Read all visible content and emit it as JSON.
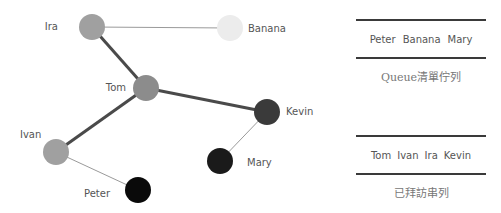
{
  "graph": {
    "nodes": [
      {
        "id": "Ira",
        "label": "Ira",
        "x": 92,
        "y": 27,
        "r": 13,
        "color": "#a0a0a0",
        "label_x": 58,
        "label_y": 30,
        "anchor": "end"
      },
      {
        "id": "Banana",
        "label": "Banana",
        "x": 230,
        "y": 28,
        "r": 13,
        "color": "#ececec",
        "label_x": 248,
        "label_y": 32,
        "anchor": "start"
      },
      {
        "id": "Tom",
        "label": "Tom",
        "x": 146,
        "y": 88,
        "r": 13,
        "color": "#8c8c8c",
        "label_x": 126,
        "label_y": 91,
        "anchor": "end"
      },
      {
        "id": "Kevin",
        "label": "Kevin",
        "x": 267,
        "y": 112,
        "r": 13,
        "color": "#3a3a3a",
        "label_x": 286,
        "label_y": 115,
        "anchor": "start"
      },
      {
        "id": "Ivan",
        "label": "Ivan",
        "x": 56,
        "y": 152,
        "r": 13,
        "color": "#a0a0a0",
        "label_x": 20,
        "label_y": 138,
        "anchor": "start"
      },
      {
        "id": "Mary",
        "label": "Mary",
        "x": 220,
        "y": 161,
        "r": 13,
        "color": "#1a1a1a",
        "label_x": 247,
        "label_y": 166,
        "anchor": "start"
      },
      {
        "id": "Peter",
        "label": "Peter",
        "x": 138,
        "y": 190,
        "r": 13,
        "color": "#0a0a0a",
        "label_x": 110,
        "label_y": 197,
        "anchor": "end"
      }
    ],
    "edges": [
      {
        "from": "Ira",
        "to": "Banana",
        "weight": "thin"
      },
      {
        "from": "Ira",
        "to": "Tom",
        "weight": "thick"
      },
      {
        "from": "Tom",
        "to": "Kevin",
        "weight": "thick"
      },
      {
        "from": "Tom",
        "to": "Ivan",
        "weight": "thick"
      },
      {
        "from": "Kevin",
        "to": "Mary",
        "weight": "thin"
      },
      {
        "from": "Ivan",
        "to": "Peter",
        "weight": "thin"
      }
    ]
  },
  "queue": {
    "items": [
      "Peter",
      "Banana",
      "Mary"
    ],
    "caption": "Queue清單佇列"
  },
  "visited": {
    "items": [
      "Tom",
      "Ivan",
      "Ira",
      "Kevin"
    ],
    "caption": "已拜訪串列"
  },
  "colors": {
    "thick_edge": "#4a4a4a",
    "thin_edge": "#9a9a9a",
    "rule": "#3a3a3a"
  }
}
